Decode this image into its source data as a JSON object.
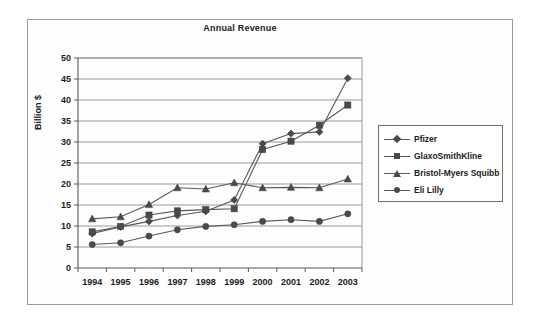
{
  "figure": {
    "title": "Annual Revenue",
    "ylabel": "Billion $",
    "background_color": "#ffffff",
    "frame_color": "#9a9a9a"
  },
  "legend": {
    "position": "right",
    "entries": [
      {
        "label": "Pfizer",
        "marker": "diamond"
      },
      {
        "label": "GlaxoSmithKline",
        "marker": "square"
      },
      {
        "label": "Bristol-Myers Squibb",
        "marker": "triangle"
      },
      {
        "label": "Eli Lilly",
        "marker": "circle"
      }
    ]
  },
  "axes": {
    "y_ticks": [
      "0",
      "5",
      "10",
      "15",
      "20",
      "25",
      "30",
      "35",
      "40",
      "45",
      "50"
    ],
    "x_ticks": [
      "1994",
      "1995",
      "1996",
      "1997",
      "1998",
      "1999",
      "2000",
      "2001",
      "2002",
      "2003"
    ]
  },
  "chart_data": {
    "type": "line",
    "title": "Annual Revenue",
    "xlabel": "",
    "ylabel": "Billion $",
    "x": [
      1994,
      1995,
      1996,
      1997,
      1998,
      1999,
      2000,
      2001,
      2002,
      2003
    ],
    "categories": [
      "1994",
      "1995",
      "1996",
      "1997",
      "1998",
      "1999",
      "2000",
      "2001",
      "2002",
      "2003"
    ],
    "ylim": [
      0,
      50
    ],
    "ytick_step": 5,
    "grid": "horizontal",
    "legend_position": "right",
    "series": [
      {
        "name": "Pfizer",
        "marker": "diamond",
        "color": "#4a4a4a",
        "values": [
          8.2,
          9.8,
          11.1,
          12.5,
          13.5,
          16.2,
          29.6,
          32.0,
          32.4,
          45.2
        ]
      },
      {
        "name": "GlaxoSmithKline",
        "marker": "square",
        "color": "#4a4a4a",
        "values": [
          8.6,
          9.9,
          12.6,
          13.6,
          13.9,
          14.1,
          28.2,
          30.2,
          34.0,
          38.8
        ]
      },
      {
        "name": "Bristol-Myers Squibb",
        "marker": "triangle",
        "color": "#4a4a4a",
        "values": [
          11.7,
          12.2,
          15.1,
          19.1,
          18.8,
          20.3,
          19.1,
          19.2,
          19.1,
          21.2
        ]
      },
      {
        "name": "Eli Lilly",
        "marker": "circle",
        "color": "#4a4a4a",
        "values": [
          5.6,
          6.0,
          7.6,
          9.1,
          9.9,
          10.3,
          11.1,
          11.5,
          11.1,
          12.9
        ]
      }
    ]
  }
}
